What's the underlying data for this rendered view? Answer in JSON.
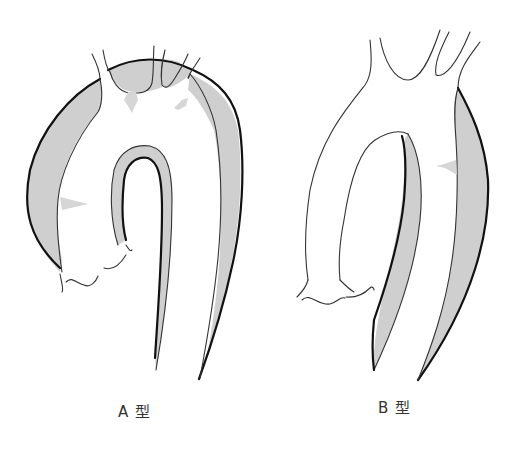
{
  "figure": {
    "colors": {
      "false_lumen": "#cfcfcf",
      "outline": "#111111",
      "background": "#ffffff",
      "label_text": "#333333"
    }
  },
  "diagrams": [
    {
      "id": "type-a",
      "label": "A 型"
    },
    {
      "id": "type-b",
      "label": "B 型"
    }
  ]
}
